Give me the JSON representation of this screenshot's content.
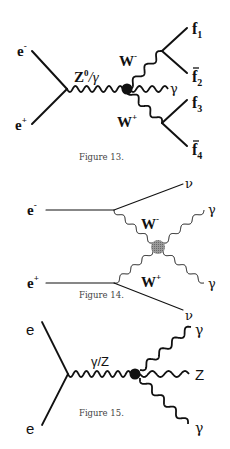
{
  "figures": [
    {
      "caption": "Figure 13.",
      "labels": {
        "e_minus": "e",
        "e_minus_sup": "-",
        "e_plus": "e",
        "e_plus_sup": "+",
        "propagator": "Z",
        "propagator_sup": "0",
        "propagator_rest": "/γ",
        "w_minus": "W",
        "w_minus_sup": "-",
        "w_plus": "W",
        "w_plus_sup": "+",
        "photon": "γ",
        "f1": "f",
        "f1_sub": "1",
        "f2": "f",
        "f2_sub": "2",
        "f3": "f",
        "f3_sub": "3",
        "f4": "f",
        "f4_sub": "4"
      }
    },
    {
      "caption": "Figure 14.",
      "labels": {
        "e_minus": "e",
        "e_minus_sup": "-",
        "e_plus": "e",
        "e_plus_sup": "+",
        "w_minus": "W",
        "w_minus_sup": "-",
        "w_plus": "W",
        "w_plus_sup": "+",
        "nu_top": "ν",
        "nu_bottom": "ν",
        "gamma_top": "γ",
        "gamma_bottom": "γ"
      }
    },
    {
      "caption": "Figure 15.",
      "labels": {
        "e_top": "e",
        "e_bottom": "e",
        "propagator": "γ/Z",
        "gamma_top": "γ",
        "z_out": "Z",
        "gamma_bottom": "γ"
      }
    }
  ],
  "colors": {
    "line": "#111111",
    "blob_fig14": "#8a8a8a",
    "caption": "#444444"
  }
}
